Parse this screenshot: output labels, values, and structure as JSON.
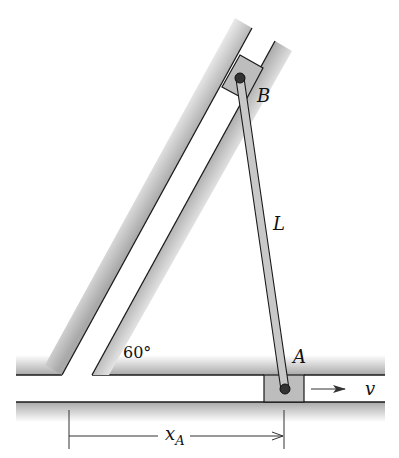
{
  "diagram": {
    "type": "mechanism",
    "labels": {
      "point_b": "B",
      "point_a": "A",
      "rod_length": "L",
      "angle": "60°",
      "velocity": "v",
      "distance_main": "x",
      "distance_sub": "A"
    },
    "colors": {
      "surface_shade": "#b8b8b8",
      "slider_fill": "#bdbdbd",
      "line": "#1a1a1a",
      "pin": "#333333",
      "rod_fill": "#c8c8c8"
    }
  }
}
